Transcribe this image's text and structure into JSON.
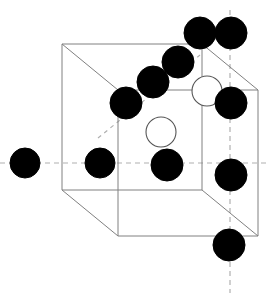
{
  "figure": {
    "background_color": "#ffffff",
    "canvas": {
      "width": 266,
      "height": 293
    }
  },
  "style": {
    "edge_color": "#808080",
    "edge_width": 1,
    "dash_color": "#b0b0b0",
    "dash_width": 1.2,
    "dash_pattern": "5 4",
    "atom_filled_color": "#000000",
    "atom_open_fill": "#ffffff",
    "atom_open_stroke": "#555555"
  },
  "unit_cell": {
    "type": "cube-oblique",
    "front_face": {
      "x1": 118,
      "y1": 90,
      "x2": 258,
      "y2": 236
    },
    "back_face": {
      "x1": 62,
      "y1": 44,
      "x2": 202,
      "y2": 190
    },
    "offset": {
      "dx": -56,
      "dy": -46
    },
    "edges": [
      {
        "name": "back-top",
        "x1": 62,
        "y1": 44,
        "x2": 202,
        "y2": 44
      },
      {
        "name": "back-right",
        "x1": 202,
        "y1": 44,
        "x2": 202,
        "y2": 190
      },
      {
        "name": "back-bottom",
        "x1": 62,
        "y1": 190,
        "x2": 202,
        "y2": 190
      },
      {
        "name": "back-left",
        "x1": 62,
        "y1": 44,
        "x2": 62,
        "y2": 190
      },
      {
        "name": "front-top",
        "x1": 118,
        "y1": 90,
        "x2": 258,
        "y2": 90
      },
      {
        "name": "front-right",
        "x1": 258,
        "y1": 90,
        "x2": 258,
        "y2": 236
      },
      {
        "name": "front-bottom",
        "x1": 118,
        "y1": 236,
        "x2": 258,
        "y2": 236
      },
      {
        "name": "front-left",
        "x1": 118,
        "y1": 90,
        "x2": 118,
        "y2": 236
      },
      {
        "name": "connector-top-left",
        "x1": 62,
        "y1": 44,
        "x2": 118,
        "y2": 90
      },
      {
        "name": "connector-top-right",
        "x1": 202,
        "y1": 44,
        "x2": 258,
        "y2": 90
      },
      {
        "name": "connector-bottom-left",
        "x1": 62,
        "y1": 190,
        "x2": 118,
        "y2": 236
      },
      {
        "name": "connector-bottom-right",
        "x1": 202,
        "y1": 190,
        "x2": 258,
        "y2": 236
      }
    ]
  },
  "axes": [
    {
      "name": "horizontal-axis",
      "orientation": "horizontal",
      "x1": 0,
      "y1": 163,
      "x2": 266,
      "y2": 163
    },
    {
      "name": "vertical-axis",
      "orientation": "vertical",
      "x1": 230,
      "y1": 10,
      "x2": 230,
      "y2": 293
    },
    {
      "name": "depth-axis",
      "orientation": "diagonal",
      "x1": 98,
      "y1": 138,
      "x2": 200,
      "y2": 55
    }
  ],
  "atoms": {
    "filled": [
      {
        "name": "atom-exterior-left",
        "cx": 25,
        "cy": 163,
        "r": 15
      },
      {
        "name": "atom-face-left",
        "cx": 100,
        "cy": 163,
        "r": 15
      },
      {
        "name": "atom-body-center-lower",
        "cx": 167,
        "cy": 165,
        "r": 16
      },
      {
        "name": "atom-diagonal-1",
        "cx": 126,
        "cy": 103,
        "r": 16
      },
      {
        "name": "atom-diagonal-2",
        "cx": 153,
        "cy": 82,
        "r": 16
      },
      {
        "name": "atom-diagonal-3",
        "cx": 178,
        "cy": 62,
        "r": 16
      },
      {
        "name": "atom-top-left-upper",
        "cx": 200,
        "cy": 33,
        "r": 16
      },
      {
        "name": "atom-top-right-upper",
        "cx": 231,
        "cy": 33,
        "r": 16
      },
      {
        "name": "atom-right-upper",
        "cx": 231,
        "cy": 103,
        "r": 16
      },
      {
        "name": "atom-right-lower",
        "cx": 231,
        "cy": 175,
        "r": 16
      },
      {
        "name": "atom-bottom-right",
        "cx": 229,
        "cy": 245,
        "r": 16
      }
    ],
    "open": [
      {
        "name": "atom-open-center",
        "cx": 161,
        "cy": 132,
        "r": 15
      },
      {
        "name": "atom-open-upper-right",
        "cx": 207,
        "cy": 91,
        "r": 15
      }
    ]
  },
  "counts": {
    "filled_atoms": 11,
    "open_atoms": 2,
    "cell_edges": 12,
    "axes": 3
  }
}
